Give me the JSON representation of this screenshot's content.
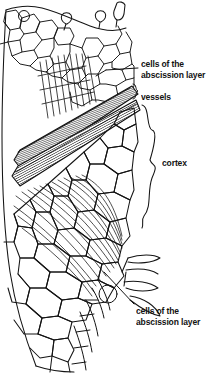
{
  "figure": {
    "kind": "botanical-line-drawing",
    "background_color": "#ffffff",
    "ink_color": "#111111"
  },
  "labels": {
    "cells_top": {
      "line1": "cells of the",
      "line2": "abscission layer",
      "leader": "line-to-upper-cell-band"
    },
    "vessels": {
      "line1": "vessels",
      "brace": "small-curly-brace"
    },
    "cortex": {
      "line1": "cortex",
      "brace": "large-curly-brace"
    },
    "cells_bottom": {
      "line1": "cells of the",
      "line2": "abscission layer",
      "leader": "line-to-lower-cell-band"
    }
  },
  "annotations": {
    "vessel_band_description": "dark diagonal hatched band of vascular tissue",
    "trichomes": "two small hair cells at top edge",
    "circles": "three small round cells along the margins"
  }
}
